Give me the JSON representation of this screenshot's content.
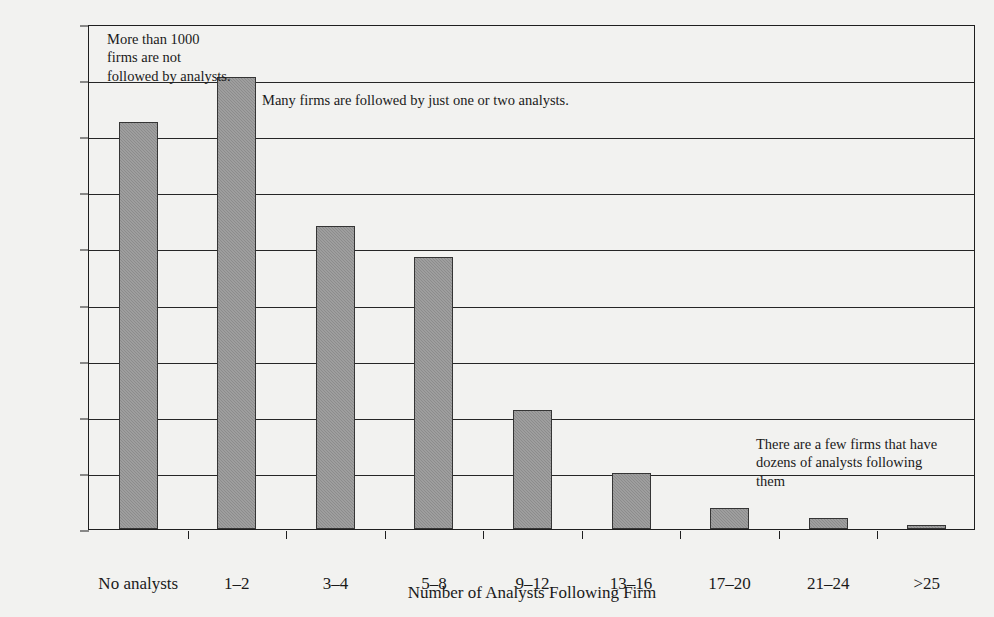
{
  "chart_data": {
    "type": "bar",
    "title": "",
    "xlabel": "Number of Analysts Following Firm",
    "ylabel": "Number of Firms",
    "categories": [
      "No analysts",
      "1–2",
      "3–4",
      "5–8",
      "9–12",
      "13–16",
      "17–20",
      "21–24",
      ">25"
    ],
    "values": [
      1450,
      1610,
      1080,
      970,
      425,
      200,
      75,
      40,
      15
    ],
    "ylim": [
      0,
      1800
    ],
    "yticks": [
      0,
      200,
      400,
      600,
      800,
      1000,
      1200,
      1400,
      1600,
      1800
    ],
    "ytick_labels": [
      "0",
      "200",
      "400",
      "600",
      "800",
      "1000",
      "1200",
      "1400",
      "1600",
      "1800"
    ],
    "grid": true,
    "legend": false,
    "bar_color": "#8c8c8c",
    "bar_edge_color": "#353535",
    "background_color": "#f2f2f0",
    "annotations": [
      "More than 1000\nfirms are not\nfollowed by analysts.",
      "Many firms are followed by just one or two analysts.",
      "There are a few firms that have\ndozens of analysts following\nthem"
    ]
  }
}
